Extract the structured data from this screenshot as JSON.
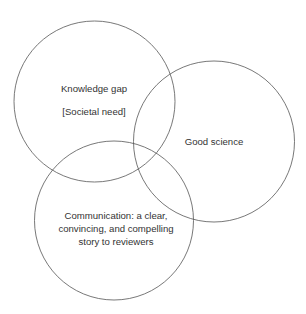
{
  "diagram": {
    "type": "venn",
    "stroke_color": "#555555",
    "circles": [
      {
        "id": "knowledge-gap",
        "cx": 94.5,
        "cy": 101.5,
        "r": 80.5,
        "lines": [
          "Knowledge gap",
          "[Societal need]"
        ]
      },
      {
        "id": "good-science",
        "cx": 214,
        "cy": 141.5,
        "r": 80.5,
        "lines": [
          "Good science"
        ]
      },
      {
        "id": "communication",
        "cx": 114,
        "cy": 220.5,
        "r": 79.5,
        "lines": [
          "Communication: a clear,",
          "convincing, and compelling",
          "story to reviewers"
        ]
      }
    ]
  }
}
